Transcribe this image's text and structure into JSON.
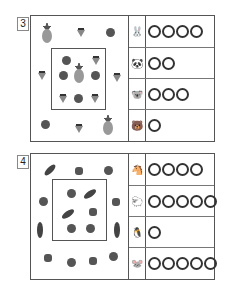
{
  "problems": [
    {
      "number": "3",
      "inner_box_items": [
        "tomato",
        "strawberry",
        "pineapple",
        "tomato",
        "tomato",
        "strawberry",
        "tomato",
        "strawberry"
      ],
      "outer_items": [
        "pineapple",
        "strawberry",
        "tomato",
        "strawberry",
        "strawberry",
        "tomato",
        "strawberry",
        "pineapple"
      ],
      "answers": [
        {
          "animal": "rabbit",
          "glyph": "🐰",
          "circles": 4
        },
        {
          "animal": "panda",
          "glyph": "🐼",
          "circles": 2
        },
        {
          "animal": "koala",
          "glyph": "🐨",
          "circles": 3
        },
        {
          "animal": "bear",
          "glyph": "🐻",
          "circles": 1
        }
      ]
    },
    {
      "number": "4",
      "inner_box_items": [
        "tomato",
        "eggplant",
        "eggplant",
        "pepper",
        "tomato",
        "tomato"
      ],
      "outer_items": [
        "eggplant",
        "pepper",
        "tomato",
        "tomato",
        "pepper",
        "eggplant",
        "eggplant",
        "pepper",
        "tomato",
        "pepper",
        "tomato"
      ],
      "answers": [
        {
          "animal": "horse",
          "glyph": "🐴",
          "circles": 4
        },
        {
          "animal": "sheep",
          "glyph": "🐑",
          "circles": 5
        },
        {
          "animal": "penguin",
          "glyph": "🐧",
          "circles": 1
        },
        {
          "animal": "mouse",
          "glyph": "🐭",
          "circles": 5
        }
      ]
    }
  ]
}
